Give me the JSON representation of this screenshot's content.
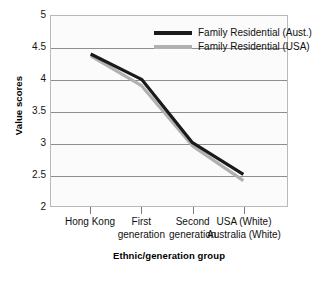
{
  "chart_data": {
    "type": "line",
    "title": "",
    "xlabel": "Ethnic/generation group",
    "ylabel": "Value scores",
    "categories": [
      "Hong Kong",
      "First generation",
      "Second generation",
      "USA (White) Australia (White)"
    ],
    "category_lines": [
      [
        "Hong Kong"
      ],
      [
        "First",
        "generation"
      ],
      [
        "Second",
        "generation"
      ],
      [
        "USA (White)",
        "Australia (White)"
      ]
    ],
    "series": [
      {
        "name": "Family Residential (Aust.)",
        "color": "#1a1a1a",
        "values": [
          4.4,
          4.0,
          3.0,
          2.5
        ]
      },
      {
        "name": "Family Residential (USA)",
        "color": "#b0b0b0",
        "values": [
          4.37,
          3.9,
          2.95,
          2.4
        ]
      }
    ],
    "ylim": [
      2,
      5
    ],
    "yticks": [
      2,
      2.5,
      3,
      3.5,
      4,
      4.5,
      5
    ],
    "ytick_labels": [
      "2",
      "2.5",
      "3",
      "3.5",
      "4",
      "4.5",
      "5"
    ],
    "grid": true,
    "grid_color": "#8e8e8e",
    "legend_position": "top-right",
    "plot_background": "#fbfbfb",
    "plot_border_color": "#b9b9b9"
  }
}
